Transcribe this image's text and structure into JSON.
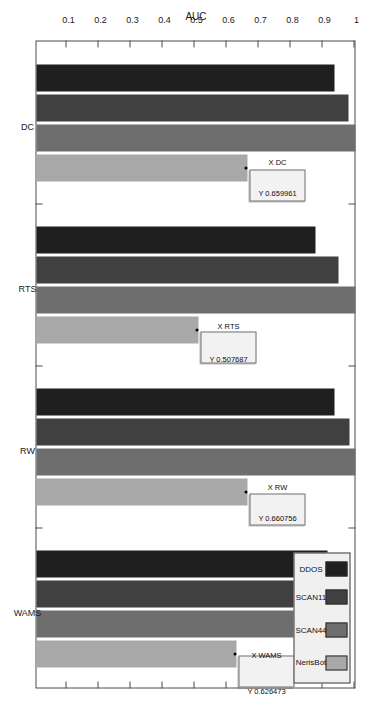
{
  "chart_data": {
    "type": "bar",
    "title": "",
    "xlabel": "",
    "ylabel": "AUC",
    "categories": [
      "DC",
      "RTS",
      "RW",
      "WAMS"
    ],
    "ylim": [
      0,
      1
    ],
    "yticks": [
      "0.1",
      "0.2",
      "0.3",
      "0.4",
      "0.5",
      "0.6",
      "0.7",
      "0.8",
      "0.9",
      "1"
    ],
    "ytick_values": [
      0.1,
      0.2,
      0.3,
      0.4,
      0.5,
      0.6,
      0.7,
      0.8,
      0.9,
      1.0
    ],
    "grid": false,
    "orientation": "rotated-90",
    "legend_position": "top-right",
    "series": [
      {
        "name": "DDOS",
        "color": "#1f1f1f",
        "values": [
          0.93,
          0.872,
          0.931,
          0.908
        ]
      },
      {
        "name": "SCAN11",
        "color": "#404040",
        "values": [
          0.975,
          0.944,
          0.978,
          0.902
        ]
      },
      {
        "name": "SCAN44",
        "color": "#6e6e6e",
        "values": [
          0.998,
          0.997,
          0.998,
          0.951
        ]
      },
      {
        "name": "NerisBot",
        "color": "#a8a8a8",
        "values": [
          0.659961,
          0.507687,
          0.660756,
          0.626473
        ]
      }
    ],
    "annotations": [
      {
        "label": "X DC",
        "value": "Y 0.659961",
        "series": "NerisBot",
        "category": "DC",
        "x_text": "X DC",
        "y_text": "Y 0.659961"
      },
      {
        "label": "X RTS",
        "value": "Y 0.507687",
        "series": "NerisBot",
        "category": "RTS",
        "x_text": "X RTS",
        "y_text": "Y 0.507687"
      },
      {
        "label": "X RW",
        "value": "Y 0.660756",
        "series": "NerisBot",
        "category": "RW",
        "x_text": "X RW",
        "y_text": "Y 0.660756"
      },
      {
        "label": "X WAMS",
        "value": "Y 0.626473",
        "series": "NerisBot",
        "category": "WAMS",
        "x_text": "X WAMS",
        "y_text": "Y 0.626473"
      }
    ]
  },
  "axes": {
    "y_axis_title": "AUC",
    "y_tick_labels": [
      "0.1",
      "0.2",
      "0.3",
      "0.4",
      "0.5",
      "0.6",
      "0.7",
      "0.8",
      "0.9",
      "1"
    ],
    "x_tick_labels": [
      "DC",
      "RTS",
      "RW",
      "WAMS"
    ]
  },
  "legend": {
    "items": [
      {
        "label": "DDOS",
        "color": "#1f1f1f"
      },
      {
        "label": "SCAN11",
        "color": "#404040"
      },
      {
        "label": "SCAN44",
        "color": "#6e6e6e"
      },
      {
        "label": "NerisBot",
        "color": "#a8a8a8"
      }
    ]
  },
  "colors": {
    "axis": "#4d4d4d",
    "background": "#ffffff",
    "text": "#1a1a1a",
    "datatip_bg": "#f2f2f2",
    "legend_bg": "#f0f0f0"
  }
}
